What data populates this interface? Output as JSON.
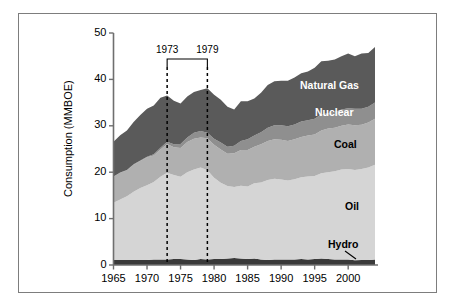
{
  "figure": {
    "border_color": "#7d7d7d",
    "background": "#ffffff"
  },
  "axes": {
    "ylabel": "Consumption (MMBOE)",
    "yticks": [
      "0",
      "10",
      "20",
      "30",
      "40",
      "50"
    ],
    "xticks": [
      "1965",
      "1970",
      "1975",
      "1980",
      "1985",
      "1990",
      "1995",
      "2000"
    ]
  },
  "annotations": {
    "event1": "1973",
    "event2": "1979"
  },
  "series_labels": {
    "natural_gas": "Natural Gas",
    "nuclear": "Nuclear",
    "coal": "Coal",
    "oil": "Oil",
    "hydro": "Hydro"
  },
  "chart_data": {
    "type": "area",
    "title": "",
    "xlabel": "",
    "ylabel": "Consumption (MMBOE)",
    "xlim": [
      1965,
      2004
    ],
    "ylim": [
      0,
      50
    ],
    "grid": false,
    "legend": "inline-labels",
    "stacked": true,
    "annotations": [
      {
        "label": "1973",
        "x": 1973,
        "type": "vertical-dashed-line"
      },
      {
        "label": "1979",
        "x": 1979,
        "type": "vertical-dashed-line"
      },
      {
        "label": "Hydro",
        "type": "leader-line-callout"
      }
    ],
    "x": [
      1965,
      1966,
      1967,
      1968,
      1969,
      1970,
      1971,
      1972,
      1973,
      1974,
      1975,
      1976,
      1977,
      1978,
      1979,
      1980,
      1981,
      1982,
      1983,
      1984,
      1985,
      1986,
      1987,
      1988,
      1989,
      1990,
      1991,
      1992,
      1993,
      1994,
      1995,
      1996,
      1997,
      1998,
      1999,
      2000,
      2001,
      2002,
      2003,
      2004
    ],
    "series": [
      {
        "name": "Hydro",
        "color": "#3a3a3a",
        "label_color": "#000000",
        "values": [
          1.1,
          1.1,
          1.1,
          1.1,
          1.1,
          1.1,
          1.2,
          1.2,
          1.2,
          1.3,
          1.3,
          1.2,
          1.1,
          1.3,
          1.2,
          1.3,
          1.3,
          1.4,
          1.5,
          1.4,
          1.3,
          1.4,
          1.2,
          1.1,
          1.2,
          1.2,
          1.2,
          1.2,
          1.3,
          1.2,
          1.3,
          1.4,
          1.3,
          1.2,
          1.2,
          1.2,
          1.0,
          1.1,
          1.1,
          1.2
        ]
      },
      {
        "name": "Oil",
        "color": "#d5d5d5",
        "label_color": "#000000",
        "values": [
          12.3,
          13.0,
          13.7,
          14.7,
          15.5,
          16.1,
          16.7,
          17.8,
          18.7,
          18.1,
          17.7,
          18.8,
          19.5,
          19.7,
          19.2,
          17.5,
          16.4,
          15.6,
          15.3,
          15.7,
          15.6,
          16.2,
          16.6,
          17.2,
          17.4,
          17.2,
          17.0,
          17.3,
          17.6,
          17.9,
          17.9,
          18.4,
          18.7,
          19.0,
          19.4,
          19.5,
          19.5,
          19.6,
          19.9,
          20.4
        ]
      },
      {
        "name": "Coal",
        "color": "#b0b0b0",
        "label_color": "#000000",
        "values": [
          5.6,
          5.8,
          5.6,
          5.8,
          5.8,
          6.0,
          5.7,
          5.9,
          6.2,
          6.0,
          6.2,
          6.5,
          6.6,
          6.5,
          6.9,
          7.1,
          7.2,
          7.0,
          7.3,
          7.7,
          7.9,
          7.9,
          8.2,
          8.4,
          8.5,
          8.6,
          8.5,
          8.6,
          8.7,
          8.8,
          8.9,
          9.2,
          9.4,
          9.4,
          9.4,
          9.6,
          9.6,
          9.5,
          9.7,
          9.9
        ]
      },
      {
        "name": "Nuclear",
        "color": "#8f8f8f",
        "label_color": "#ffffff",
        "values": [
          0.05,
          0.05,
          0.07,
          0.1,
          0.12,
          0.15,
          0.25,
          0.35,
          0.45,
          0.6,
          0.9,
          1.0,
          1.3,
          1.4,
          1.2,
          1.3,
          1.5,
          1.5,
          1.6,
          1.9,
          2.3,
          2.4,
          2.6,
          2.9,
          3.0,
          3.1,
          3.2,
          3.2,
          3.3,
          3.3,
          3.4,
          3.5,
          3.3,
          3.4,
          3.5,
          3.5,
          3.6,
          3.5,
          3.4,
          3.5
        ]
      },
      {
        "name": "Natural Gas",
        "color": "#5a5a5a",
        "label_color": "#ffffff",
        "values": [
          7.5,
          8.0,
          8.5,
          9.1,
          9.8,
          10.3,
          10.5,
          10.8,
          10.0,
          9.4,
          8.7,
          8.8,
          8.8,
          8.8,
          9.6,
          9.5,
          9.2,
          8.6,
          7.8,
          8.6,
          8.2,
          8.0,
          8.5,
          9.2,
          9.5,
          9.6,
          9.8,
          10.1,
          10.4,
          10.5,
          11.0,
          11.4,
          11.3,
          11.3,
          11.5,
          11.8,
          11.3,
          11.9,
          11.6,
          12.0
        ]
      }
    ]
  }
}
